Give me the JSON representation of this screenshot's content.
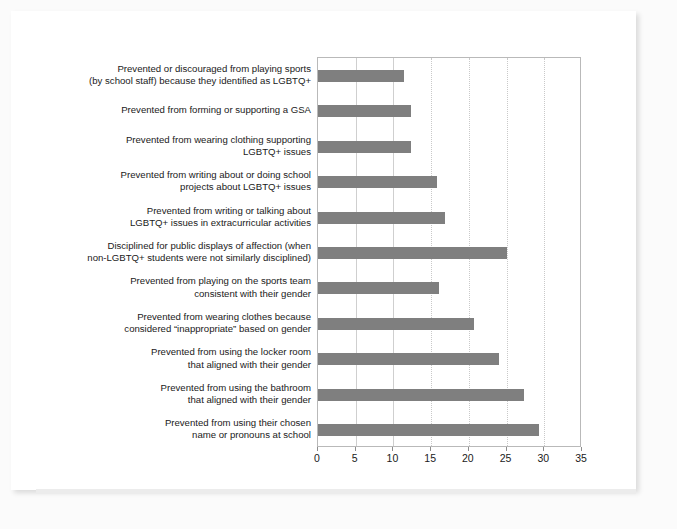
{
  "chart_data": {
    "type": "bar",
    "orientation": "horizontal",
    "title": "",
    "subtitle": "",
    "xlabel": "",
    "ylabel": "",
    "xlim": [
      0,
      35
    ],
    "xticks": [
      0,
      5,
      10,
      15,
      20,
      25,
      30,
      35
    ],
    "grid": true,
    "legend": null,
    "bar_color": "#7f7f7f",
    "categories": [
      "Prevented or discouraged from playing sports\n(by school staff) because they identified as LGBTQ+",
      "Prevented from forming or supporting a GSA",
      "Prevented from wearing clothing supporting\nLGBTQ+ issues",
      "Prevented from writing about or doing school\nprojects about LGBTQ+ issues",
      "Prevented from writing or talking about\nLGBTQ+ issues in extracurricular activities",
      "Disciplined for public displays of affection (when\nnon-LGBTQ+ students were not similarly disciplined)",
      "Prevented from playing on the sports team\nconsistent with their gender",
      "Prevented from wearing clothes because\nconsidered “inappropriate” based on gender",
      "Prevented from using the locker room\nthat aligned with their gender",
      "Prevented from using the bathroom\nthat aligned with their gender",
      "Prevented from using their chosen\nname or pronouns at school"
    ],
    "values": [
      11.4,
      12.3,
      12.3,
      15.8,
      16.9,
      25.1,
      16.1,
      20.7,
      24.0,
      27.3,
      29.3
    ]
  }
}
